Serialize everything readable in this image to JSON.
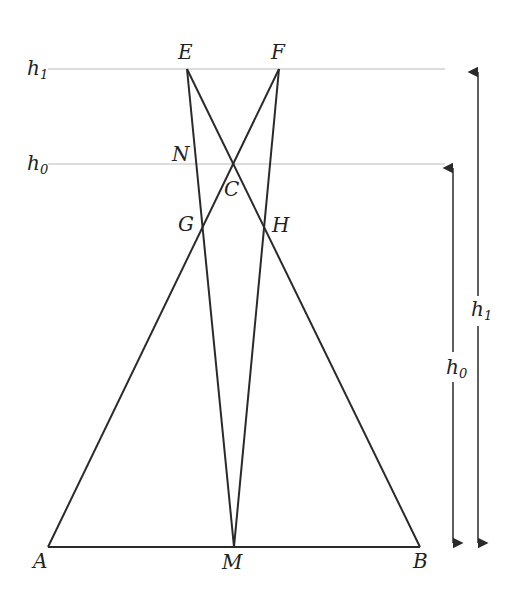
{
  "diagram": {
    "colors": {
      "line": "#2a2a2a",
      "guide": "#bbbbbb",
      "text": "#222222"
    },
    "points": {
      "A": {
        "label": "A",
        "x": 48,
        "y": 547
      },
      "M": {
        "label": "M",
        "x": 234,
        "y": 547
      },
      "B": {
        "label": "B",
        "x": 420,
        "y": 547
      },
      "E": {
        "label": "E",
        "x": 187,
        "y": 69
      },
      "F": {
        "label": "F",
        "x": 279,
        "y": 69
      },
      "C": {
        "label": "C",
        "x": 233,
        "y": 163
      },
      "N": {
        "label": "N",
        "x": 193,
        "y": 155
      },
      "G": {
        "label": "G",
        "x": 202,
        "y": 228
      },
      "H": {
        "label": "H",
        "x": 265,
        "y": 228
      }
    },
    "levels": [
      {
        "label": "h",
        "sub": "1",
        "y": 69
      },
      {
        "label": "h",
        "sub": "0",
        "y": 164
      }
    ],
    "arrows": [
      {
        "label": "h",
        "sub": "0",
        "x": 453,
        "y1": 164,
        "y2": 547
      },
      {
        "label": "h",
        "sub": "1",
        "x": 478,
        "y1": 68,
        "y2": 547
      }
    ]
  }
}
